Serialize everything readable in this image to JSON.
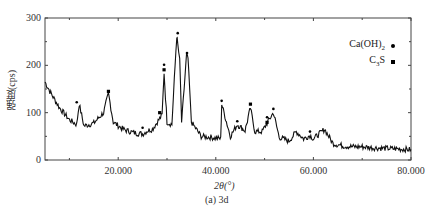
{
  "chart_data": {
    "type": "line",
    "title": "",
    "caption": "(a) 3d",
    "xlabel": "2θ(°)",
    "ylabel": "强度(cps)",
    "xlim": [
      5,
      80
    ],
    "ylim": [
      0,
      300
    ],
    "x_ticks": [
      20,
      40,
      60,
      80
    ],
    "x_tick_labels": [
      "20.000",
      "40.000",
      "60.000",
      "80.000"
    ],
    "y_ticks": [
      0,
      100,
      200,
      300
    ],
    "y_tick_labels": [
      "0",
      "100",
      "200",
      "300"
    ],
    "grid": false,
    "legend": [
      {
        "label": "Ca(OH)2",
        "marker": "circle"
      },
      {
        "label": "C3S",
        "marker": "square"
      }
    ],
    "legend_position": "upper right",
    "series": [
      {
        "name": "3d XRD pattern",
        "x": [
          5,
          6,
          8,
          10,
          11.5,
          12,
          13,
          15,
          17,
          18,
          19,
          21,
          23,
          25,
          26,
          27,
          28,
          29,
          29.4,
          30,
          31,
          32,
          32.2,
          32.6,
          33,
          34,
          34.3,
          35,
          37,
          39,
          41,
          41.2,
          43,
          44.4,
          46,
          47.1,
          48,
          49.5,
          50.5,
          51.8,
          53,
          55,
          56.5,
          58,
          59.3,
          60,
          62.3,
          64,
          66,
          68,
          70,
          72,
          74,
          76,
          78,
          80
        ],
        "values": [
          165,
          145,
          110,
          85,
          75,
          118,
          72,
          78,
          100,
          140,
          80,
          65,
          58,
          55,
          62,
          65,
          80,
          95,
          185,
          80,
          75,
          262,
          245,
          210,
          80,
          220,
          215,
          80,
          50,
          48,
          45,
          118,
          50,
          75,
          62,
          110,
          60,
          60,
          78,
          100,
          48,
          40,
          60,
          45,
          52,
          45,
          65,
          35,
          30,
          28,
          28,
          26,
          25,
          24,
          23,
          22
        ]
      }
    ],
    "annotations": [
      {
        "x": 11.5,
        "y": 122,
        "marker": "circle"
      },
      {
        "x": 18,
        "y": 145,
        "marker": "square"
      },
      {
        "x": 25,
        "y": 68,
        "marker": "circle"
      },
      {
        "x": 28.5,
        "y": 100,
        "marker": "square"
      },
      {
        "x": 29.4,
        "y": 195,
        "marker": "circle+square"
      },
      {
        "x": 32.2,
        "y": 268,
        "marker": "circle"
      },
      {
        "x": 34.1,
        "y": 226,
        "marker": "circle"
      },
      {
        "x": 41.2,
        "y": 125,
        "marker": "circle"
      },
      {
        "x": 44.4,
        "y": 82,
        "marker": "circle"
      },
      {
        "x": 47.1,
        "y": 118,
        "marker": "square"
      },
      {
        "x": 50.5,
        "y": 84,
        "marker": "circle+square"
      },
      {
        "x": 51.8,
        "y": 108,
        "marker": "circle"
      },
      {
        "x": 59.3,
        "y": 60,
        "marker": "circle"
      }
    ]
  }
}
